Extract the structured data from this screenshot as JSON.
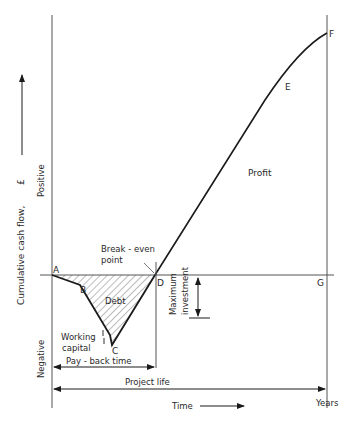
{
  "diagram": {
    "y_axis": {
      "label": "Cumulative cash flow,",
      "unit": "£",
      "positive_label": "Positive",
      "negative_label": "Negative"
    },
    "x_axis": {
      "label": "Time",
      "unit_label": "Years"
    },
    "points": {
      "A": "A",
      "B": "B",
      "C": "C",
      "D": "D",
      "E": "E",
      "F": "F",
      "G": "G"
    },
    "annotations": {
      "break_even": "Break - even",
      "break_even_2": "point",
      "debt": "Debt",
      "profit": "Profit",
      "working_capital_1": "Working",
      "working_capital_2": "capital",
      "max_investment_1": "Maximum",
      "max_investment_2": "investment",
      "payback_time": "Pay - back time",
      "project_life": "Project life"
    },
    "colors": {
      "line": "#1a1a1a",
      "axis": "#555555",
      "hatch": "#444444"
    }
  }
}
